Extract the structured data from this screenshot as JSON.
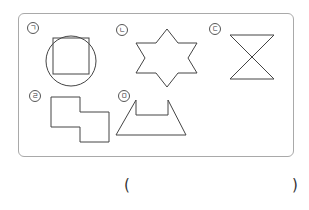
{
  "figure": {
    "panel_border_color": "#a9a9a9",
    "stroke_color": "#444444",
    "items": [
      {
        "label": "ㄱ",
        "shape": "circle-with-inscribed-square"
      },
      {
        "label": "ㄴ",
        "shape": "six-pointed-star"
      },
      {
        "label": "ㄷ",
        "shape": "hourglass"
      },
      {
        "label": "ㄹ",
        "shape": "stepped-rectangles"
      },
      {
        "label": "ㅁ",
        "shape": "trapezoid-with-notch"
      }
    ]
  },
  "answer": {
    "open_paren": "(",
    "close_paren": ")",
    "value": ""
  }
}
